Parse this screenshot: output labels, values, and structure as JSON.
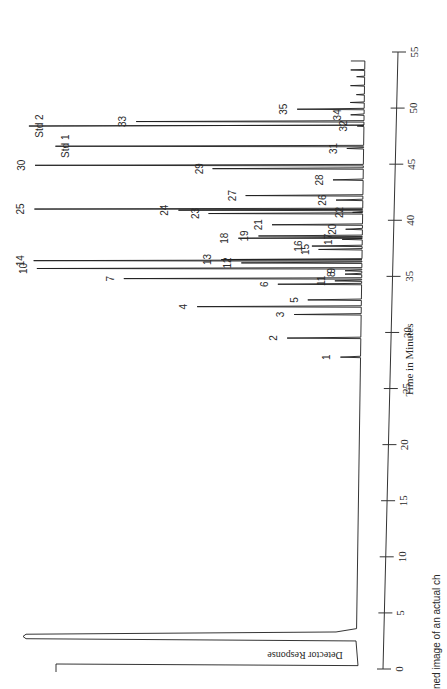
{
  "chart_data": {
    "type": "line",
    "subtype": "chromatogram",
    "orientation": "rotated-90-ccw",
    "title": "",
    "xlabel": "Time in Minutes",
    "ylabel": "Detector Response",
    "xlim": [
      0,
      55
    ],
    "x_ticks": [
      0,
      5,
      10,
      15,
      20,
      25,
      30,
      35,
      40,
      45,
      50,
      55
    ],
    "grid": false,
    "legend": null,
    "peaks": [
      {
        "label": "1",
        "time": 27.8,
        "height": 0.06
      },
      {
        "label": "2",
        "time": 29.5,
        "height": 0.22
      },
      {
        "label": "3",
        "time": 31.6,
        "height": 0.2
      },
      {
        "label": "4",
        "time": 32.3,
        "height": 0.49
      },
      {
        "label": "5",
        "time": 32.9,
        "height": 0.16
      },
      {
        "label": "6",
        "time": 34.3,
        "height": 0.25
      },
      {
        "label": "7",
        "time": 34.8,
        "height": 0.71
      },
      {
        "label": "8",
        "time": 35.2,
        "height": 0.05
      },
      {
        "label": "9",
        "time": 35.5,
        "height": 0.05
      },
      {
        "label": "10",
        "time": 35.7,
        "height": 0.97
      },
      {
        "label": "11",
        "time": 34.6,
        "height": 0.08
      },
      {
        "label": "12",
        "time": 36.2,
        "height": 0.36
      },
      {
        "label": "13",
        "time": 36.5,
        "height": 0.42
      },
      {
        "label": "14",
        "time": 36.4,
        "height": 0.98
      },
      {
        "label": "15",
        "time": 37.4,
        "height": 0.13
      },
      {
        "label": "16",
        "time": 37.7,
        "height": 0.15
      },
      {
        "label": "17",
        "time": 38.3,
        "height": 0.06
      },
      {
        "label": "18",
        "time": 38.4,
        "height": 0.37
      },
      {
        "label": "19",
        "time": 38.6,
        "height": 0.31
      },
      {
        "label": "20",
        "time": 39.2,
        "height": 0.05
      },
      {
        "label": "21",
        "time": 39.6,
        "height": 0.27
      },
      {
        "label": "22",
        "time": 40.7,
        "height": 0.03
      },
      {
        "label": "23",
        "time": 40.6,
        "height": 0.46
      },
      {
        "label": "24",
        "time": 40.9,
        "height": 0.55
      },
      {
        "label": "25",
        "time": 41.0,
        "height": 0.98
      },
      {
        "label": "26",
        "time": 41.8,
        "height": 0.08
      },
      {
        "label": "27",
        "time": 42.2,
        "height": 0.35
      },
      {
        "label": "28",
        "time": 43.6,
        "height": 0.09
      },
      {
        "label": "29",
        "time": 44.6,
        "height": 0.45
      },
      {
        "label": "30",
        "time": 44.9,
        "height": 0.98
      },
      {
        "label": "31",
        "time": 46.4,
        "height": 0.05
      },
      {
        "label": "Std 1",
        "time": 46.6,
        "height": 0.92
      },
      {
        "label": "32",
        "time": 48.4,
        "height": 0.02
      },
      {
        "label": "33",
        "time": 48.8,
        "height": 0.68
      },
      {
        "label": "34",
        "time": 49.4,
        "height": 0.04
      },
      {
        "label": "35",
        "time": 49.9,
        "height": 0.2
      },
      {
        "label": "Std 2",
        "time": 48.4,
        "height": 1.0
      }
    ],
    "solvent_peak": {
      "time": 3.2,
      "height": 1.0,
      "offscale": true
    },
    "annotations": [
      "Std 1",
      "Std 2"
    ]
  },
  "caption_fragment": "ned image of an actual ch"
}
